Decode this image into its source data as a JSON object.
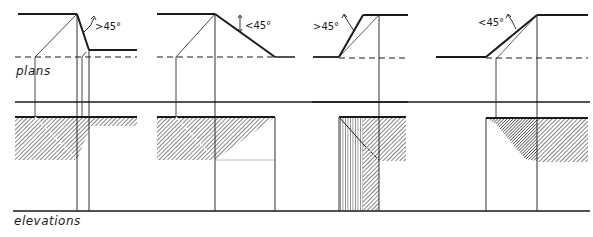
{
  "labels": {
    "plans": "plans",
    "elevations": "elevations"
  },
  "colors": {
    "ink": "#1a1a1a",
    "paper": "#ffffff",
    "hatch": "#333333"
  },
  "panels": [
    {
      "id": 1,
      "angle_label": ">45°",
      "description": "steep slope, shadow projected at ridge"
    },
    {
      "id": 2,
      "angle_label": "<45°",
      "description": "shallow slope descending"
    },
    {
      "id": 3,
      "angle_label": ">45°",
      "description": "steep slope ascending, vertical hatch"
    },
    {
      "id": 4,
      "angle_label": "<45°",
      "description": "shallow slope ascending"
    }
  ]
}
